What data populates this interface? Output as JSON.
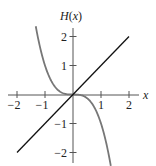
{
  "chart_data": {
    "type": "line",
    "title": "",
    "xlabel": "x",
    "ylabel": "H(x)",
    "xlim": [
      -2.2,
      2.35
    ],
    "ylim": [
      -2.35,
      2.3
    ],
    "x_ticks": [
      -2,
      -1,
      1,
      2
    ],
    "x_tick_labels": [
      "−2",
      "−1",
      "1",
      "2"
    ],
    "y_ticks": [
      -2,
      -1,
      1,
      2
    ],
    "y_tick_labels": [
      "−2",
      "−1",
      "1",
      "2"
    ],
    "grid": false,
    "legend": null,
    "series": [
      {
        "name": "H(x) = -x^3",
        "color": "#777777",
        "x": [
          -1.33,
          -1.2,
          -1.0,
          -0.8,
          -0.6,
          -0.4,
          -0.2,
          0,
          0.2,
          0.4,
          0.6,
          0.8,
          1.0,
          1.2,
          1.35
        ],
        "y": [
          2.35,
          1.728,
          1.0,
          0.512,
          0.216,
          0.064,
          0.008,
          0,
          -0.008,
          -0.064,
          -0.216,
          -0.512,
          -1.0,
          -1.728,
          -2.46
        ]
      },
      {
        "name": "y = x",
        "color": "#111111",
        "x": [
          -2,
          2
        ],
        "y": [
          -2,
          2
        ]
      }
    ]
  },
  "axes": {
    "x_label": "x",
    "y_label": "H(x)"
  },
  "colors": {
    "axis": "#555555",
    "curve": "#777777",
    "line": "#111111"
  }
}
